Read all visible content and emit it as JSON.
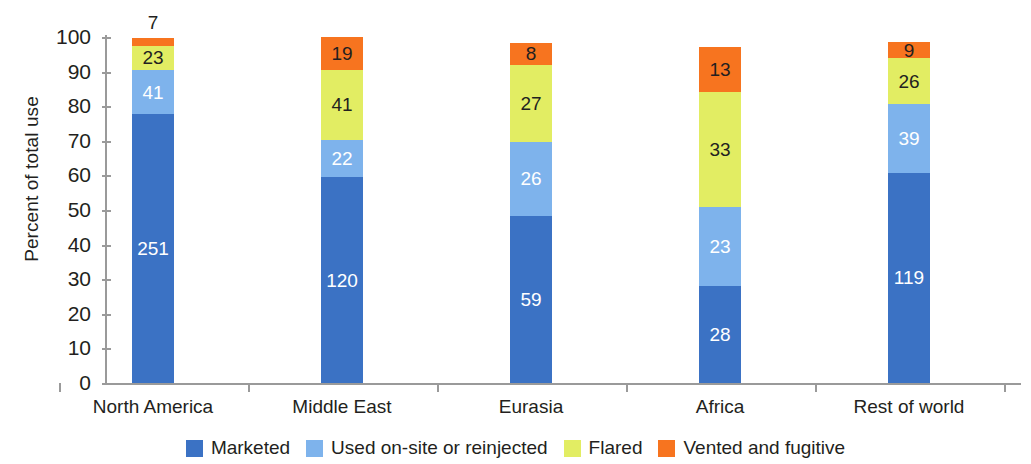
{
  "chart_data": {
    "type": "bar",
    "subtype": "stacked-100-percent",
    "title": "",
    "xlabel": "",
    "ylabel": "Percent of total use",
    "ylim": [
      0,
      100
    ],
    "ytick_labels": [
      "100",
      "90",
      "80",
      "70",
      "60",
      "50",
      "40",
      "30",
      "20",
      "10",
      "0"
    ],
    "ytick_values": [
      100,
      90,
      80,
      70,
      60,
      50,
      40,
      30,
      20,
      10,
      0
    ],
    "grid": false,
    "legend_position": "bottom",
    "categories": [
      "North America",
      "Middle East",
      "Eurasia",
      "Africa",
      "Rest of world"
    ],
    "series": [
      {
        "name": "Marketed",
        "color": "#3b72c4",
        "label_color": "#ffffff",
        "values": [
          251,
          120,
          59,
          28,
          119
        ],
        "percents": [
          77.7,
          59.4,
          48.4,
          28.0,
          60.7
        ]
      },
      {
        "name": "Used on-site or reinjected",
        "color": "#7eb3ec",
        "label_color": "#ffffff",
        "values": [
          41,
          22,
          26,
          23,
          39
        ],
        "percents": [
          12.7,
          10.9,
          21.3,
          23.0,
          19.9
        ]
      },
      {
        "name": "Flared",
        "color": "#e2ed63",
        "label_color": "#231f20",
        "values": [
          23,
          41,
          27,
          33,
          26
        ],
        "percents": [
          7.1,
          20.3,
          22.1,
          33.0,
          13.3
        ]
      },
      {
        "name": "Vented and fugitive",
        "color": "#f7741f",
        "label_color": "#231f20",
        "values": [
          7,
          19,
          8,
          13,
          9
        ],
        "percents": [
          2.2,
          9.4,
          6.6,
          13.0,
          4.6
        ],
        "label_outside": [
          true,
          false,
          false,
          false,
          false
        ]
      }
    ]
  },
  "axis": {
    "y_title": "Percent of total use"
  },
  "colors": {
    "marketed": "#3b72c4",
    "used_onsite": "#7eb3ec",
    "flared": "#e2ed63",
    "vented": "#f7741f",
    "axis": "#9a9a9a",
    "text": "#231f20"
  }
}
